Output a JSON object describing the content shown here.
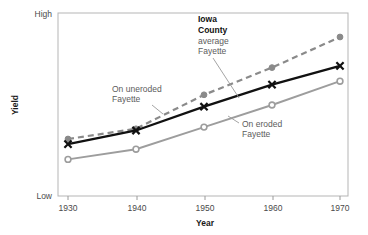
{
  "chart_data": {
    "type": "line",
    "title": "",
    "xlabel": "Year",
    "ylabel": "Yield",
    "x": [
      1930,
      1940,
      1950,
      1960,
      1970
    ],
    "categories": [
      "1930",
      "1940",
      "1950",
      "1960",
      "1970"
    ],
    "xlim": [
      1925,
      1975
    ],
    "ylim": [
      0,
      100
    ],
    "ytick_labels": [
      "Low",
      "High"
    ],
    "y_axis_low_label": "Low",
    "y_axis_high_label": "High",
    "grid": false,
    "legend_position": "inline-annotations",
    "series": [
      {
        "name": "On uneroded Fayette",
        "color": "#8a8a8a",
        "style": "dashed",
        "marker": "filled-circle",
        "values": [
          30,
          36,
          56,
          72,
          90
        ]
      },
      {
        "name": "Iowa County average Fayette",
        "color": "#111111",
        "style": "solid",
        "marker": "x",
        "values": [
          27,
          35,
          49,
          62,
          73
        ]
      },
      {
        "name": "On eroded Fayette",
        "color": "#9d9d9d",
        "style": "solid",
        "marker": "open-circle",
        "values": [
          18,
          24,
          37,
          50,
          64
        ]
      }
    ],
    "annotations": [
      {
        "id": "anno-uneroded",
        "lines": [
          "On uneroded",
          "Fayette"
        ],
        "bold": false,
        "color": "#5c5c5c"
      },
      {
        "id": "anno-iowa-county",
        "lines": [
          "Iowa",
          "County"
        ],
        "bold": true,
        "color": "#111111"
      },
      {
        "id": "anno-iowa-county-sub",
        "lines": [
          "average",
          "Fayette"
        ],
        "bold": false,
        "color": "#8a8a8a"
      },
      {
        "id": "anno-eroded",
        "lines": [
          "On eroded",
          "Fayette"
        ],
        "bold": false,
        "color": "#5c5c5c"
      }
    ]
  },
  "axes": {
    "x_title": "Year",
    "y_title": "Yield",
    "y_high": "High",
    "y_low": "Low",
    "xticks": [
      "1930",
      "1940",
      "1950",
      "1960",
      "1970"
    ]
  },
  "annotations": {
    "uneroded_line1": "On uneroded",
    "uneroded_line2": "Fayette",
    "iowa_line1": "Iowa",
    "iowa_line2": "County",
    "iowa_sub1": "average",
    "iowa_sub2": "Fayette",
    "eroded_line1": "On eroded",
    "eroded_line2": "Fayette"
  }
}
